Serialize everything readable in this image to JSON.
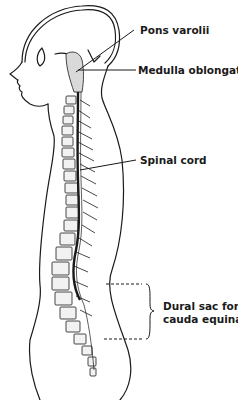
{
  "diagram": {
    "labels": [
      {
        "id": "pons",
        "text": "Pons varolii"
      },
      {
        "id": "medulla",
        "text": "Medulla oblongata"
      },
      {
        "id": "spinal_cord",
        "text": "Spinal cord"
      },
      {
        "id": "dural_sac_line1",
        "text": "Dural sac for"
      },
      {
        "id": "dural_sac_line2",
        "text": "cauda equina"
      }
    ],
    "colors": {
      "ink": "#1a1a1a",
      "background": "#ffffff",
      "bone_fill": "#f2f2f2"
    }
  }
}
